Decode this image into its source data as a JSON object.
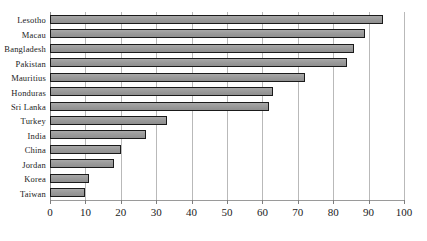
{
  "chart_data": {
    "type": "bar",
    "orientation": "horizontal",
    "title": "",
    "xlabel": "",
    "ylabel": "",
    "xlim": [
      0,
      100
    ],
    "xticks": [
      0,
      10,
      20,
      30,
      40,
      50,
      60,
      70,
      80,
      90,
      100
    ],
    "grid": true,
    "legend": false,
    "bar_color": "#9e9e9e",
    "bar_edge_color": "#1a1a1a",
    "categories": [
      "Lesotho",
      "Macau",
      "Bangladesh",
      "Pakistan",
      "Mauritius",
      "Honduras",
      "Sri Lanka",
      "Turkey",
      "India",
      "China",
      "Jordan",
      "Korea",
      "Taiwan"
    ],
    "values": [
      94,
      89,
      86,
      84,
      72,
      63,
      62,
      33,
      27,
      20,
      18,
      11,
      10
    ]
  }
}
